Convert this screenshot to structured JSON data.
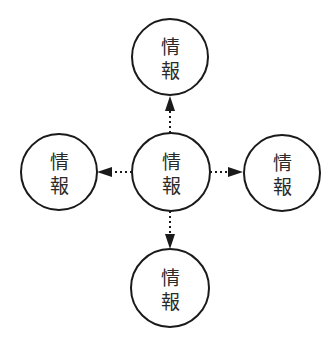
{
  "diagram": {
    "type": "hub-and-spoke",
    "nodes": [
      {
        "id": "top",
        "line1": "情",
        "line2": "報",
        "cx": 170,
        "cy": 57
      },
      {
        "id": "left",
        "line1": "情",
        "line2": "報",
        "cx": 59,
        "cy": 172
      },
      {
        "id": "center",
        "line1": "情",
        "line2": "報",
        "cx": 171,
        "cy": 172
      },
      {
        "id": "right",
        "line1": "情",
        "line2": "報",
        "cx": 282,
        "cy": 173
      },
      {
        "id": "bottom",
        "line1": "情",
        "line2": "報",
        "cx": 170,
        "cy": 288
      }
    ],
    "edges": [
      {
        "from": "center",
        "to": "top",
        "style": "dotted",
        "arrow": "filled"
      },
      {
        "from": "center",
        "to": "left",
        "style": "dotted",
        "arrow": "filled"
      },
      {
        "from": "center",
        "to": "right",
        "style": "dotted",
        "arrow": "filled"
      },
      {
        "from": "center",
        "to": "bottom",
        "style": "dotted",
        "arrow": "filled"
      }
    ],
    "colors": {
      "stroke": "#1a1a1a",
      "fill": "#ffffff",
      "text": "#2a2a2a"
    }
  }
}
